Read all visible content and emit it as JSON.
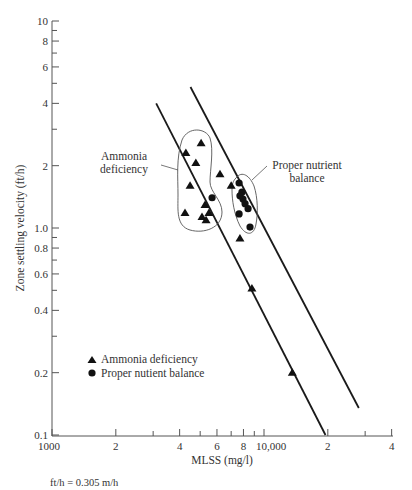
{
  "chart_data": {
    "type": "scatter",
    "title": "",
    "xlabel": "MLSS (mg/l)",
    "ylabel": "Zone settling velocity (ft/h)",
    "xscale": "log",
    "yscale": "log",
    "xlim": [
      1000,
      40000
    ],
    "ylim": [
      0.1,
      10
    ],
    "grid": false,
    "x_ticks": [
      {
        "value": 1000,
        "label": "1000"
      },
      {
        "value": 2000,
        "label": "2"
      },
      {
        "value": 3000,
        "label": ""
      },
      {
        "value": 4000,
        "label": "4"
      },
      {
        "value": 5000,
        "label": ""
      },
      {
        "value": 6000,
        "label": "6"
      },
      {
        "value": 7000,
        "label": ""
      },
      {
        "value": 8000,
        "label": "8"
      },
      {
        "value": 9000,
        "label": ""
      },
      {
        "value": 10000,
        "label": "10,000"
      },
      {
        "value": 20000,
        "label": "2"
      },
      {
        "value": 30000,
        "label": ""
      },
      {
        "value": 40000,
        "label": "4"
      }
    ],
    "y_ticks": [
      {
        "value": 0.1,
        "label": "0.1"
      },
      {
        "value": 0.2,
        "label": "0.2"
      },
      {
        "value": 0.3,
        "label": ""
      },
      {
        "value": 0.4,
        "label": "0.4"
      },
      {
        "value": 0.5,
        "label": ""
      },
      {
        "value": 0.6,
        "label": "0.6"
      },
      {
        "value": 0.7,
        "label": ""
      },
      {
        "value": 0.8,
        "label": "0.8"
      },
      {
        "value": 0.9,
        "label": ""
      },
      {
        "value": 1.0,
        "label": "1.0"
      },
      {
        "value": 2,
        "label": "2"
      },
      {
        "value": 3,
        "label": ""
      },
      {
        "value": 4,
        "label": "4"
      },
      {
        "value": 5,
        "label": ""
      },
      {
        "value": 6,
        "label": "6"
      },
      {
        "value": 7,
        "label": ""
      },
      {
        "value": 8,
        "label": "8"
      },
      {
        "value": 9,
        "label": ""
      },
      {
        "value": 10,
        "label": "10"
      }
    ],
    "series": [
      {
        "name": "Ammonia deficiency",
        "marker": "triangle",
        "points": [
          {
            "x": 5050,
            "y": 2.57
          },
          {
            "x": 4280,
            "y": 2.3
          },
          {
            "x": 4770,
            "y": 2.06
          },
          {
            "x": 4480,
            "y": 1.6
          },
          {
            "x": 6200,
            "y": 1.82
          },
          {
            "x": 7000,
            "y": 1.6
          },
          {
            "x": 5270,
            "y": 1.29
          },
          {
            "x": 4240,
            "y": 1.18
          },
          {
            "x": 5500,
            "y": 1.18
          },
          {
            "x": 5100,
            "y": 1.13
          },
          {
            "x": 5330,
            "y": 1.09
          },
          {
            "x": 7700,
            "y": 0.89
          },
          {
            "x": 8770,
            "y": 0.51
          },
          {
            "x": 13600,
            "y": 0.2
          }
        ]
      },
      {
        "name": "Proper nutient balance",
        "marker": "circle",
        "points": [
          {
            "x": 5690,
            "y": 1.4
          },
          {
            "x": 7630,
            "y": 1.65
          },
          {
            "x": 7870,
            "y": 1.49
          },
          {
            "x": 7700,
            "y": 1.43
          },
          {
            "x": 7960,
            "y": 1.38
          },
          {
            "x": 8140,
            "y": 1.31
          },
          {
            "x": 8410,
            "y": 1.24
          },
          {
            "x": 7630,
            "y": 1.17
          },
          {
            "x": 8590,
            "y": 1.01
          }
        ]
      }
    ],
    "lines": [
      {
        "name": "lower-bound-line",
        "from": {
          "x": 3100,
          "y": 4.0
        },
        "to": {
          "x": 19500,
          "y": 0.1
        }
      },
      {
        "name": "upper-bound-line",
        "from": {
          "x": 4500,
          "y": 4.8
        },
        "to": {
          "x": 28000,
          "y": 0.135
        }
      }
    ],
    "annotations": [
      {
        "text_lines": [
          "Ammonia",
          "deficiency"
        ],
        "target": "ammonia-cluster"
      },
      {
        "text_lines": [
          "Proper nutrient",
          "balance"
        ],
        "target": "nutrient-cluster"
      }
    ],
    "legend": {
      "position": "lower-left",
      "entries": [
        {
          "marker": "triangle",
          "label": "Ammonia deficiency"
        },
        {
          "marker": "circle",
          "label": "Proper nutient balance"
        }
      ]
    },
    "footnote": "ft/h = 0.305 m/h"
  }
}
